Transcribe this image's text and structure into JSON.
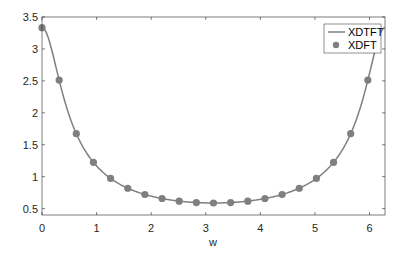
{
  "chart_data": {
    "type": "line",
    "title": "",
    "xlabel": "w",
    "ylabel": "",
    "xlim": [
      0,
      6.2832
    ],
    "ylim": [
      0.4,
      3.5
    ],
    "xticks": [
      0,
      1,
      2,
      3,
      4,
      5,
      6
    ],
    "yticks": [
      0.5,
      1,
      1.5,
      2,
      2.5,
      3,
      3.5
    ],
    "ytick_labels": [
      "0.5",
      "1",
      "1.5",
      "2",
      "2.5",
      "3",
      "3.5"
    ],
    "xtick_labels": [
      "0",
      "1",
      "2",
      "3",
      "4",
      "5",
      "6"
    ],
    "grid": false,
    "legend_position": "upper right",
    "series": [
      {
        "name": "XDTFT",
        "style": "line",
        "color": "#7f7f7f",
        "formula": "1/sqrt(1.49-1.4*cos(w))"
      },
      {
        "name": "XDFT",
        "style": "markers",
        "color": "#7f7f7f",
        "x": [
          0,
          0.3142,
          0.6283,
          0.9425,
          1.2566,
          1.5708,
          1.885,
          2.1991,
          2.5133,
          2.8274,
          3.1416,
          3.4558,
          3.7699,
          4.0841,
          4.3982,
          4.7124,
          5.0265,
          5.3407,
          5.6549,
          5.969
        ],
        "values": [
          3.333,
          2.512,
          1.673,
          1.224,
          0.972,
          0.819,
          0.721,
          0.658,
          0.617,
          0.595,
          0.588,
          0.595,
          0.617,
          0.658,
          0.721,
          0.819,
          0.972,
          1.224,
          1.673,
          2.512
        ]
      }
    ]
  },
  "legend": {
    "line_label": "XDTFT",
    "marker_label": "XDFT"
  },
  "axes": {
    "xlabel": "w"
  }
}
